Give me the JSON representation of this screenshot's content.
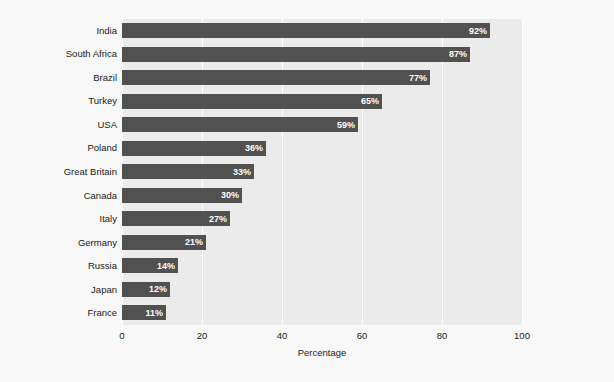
{
  "chart_data": {
    "type": "bar",
    "orientation": "horizontal",
    "title": "",
    "subtitle": "",
    "xlabel": "Percentage",
    "ylabel": "",
    "xlim": [
      0,
      100
    ],
    "xticks": [
      0,
      20,
      40,
      60,
      80,
      100
    ],
    "xtick_labels": [
      "0",
      "20",
      "40",
      "60",
      "80",
      "100"
    ],
    "grid": true,
    "grid_axis": "x",
    "legend": false,
    "legend_position": "none",
    "categories": [
      "India",
      "South Africa",
      "Brazil",
      "Turkey",
      "USA",
      "Poland",
      "Great Britain",
      "Canada",
      "Italy",
      "Germany",
      "Russia",
      "Japan",
      "France"
    ],
    "values": [
      92,
      87,
      77,
      65,
      59,
      36,
      33,
      30,
      27,
      21,
      14,
      12,
      11
    ],
    "value_labels": [
      "92%",
      "87%",
      "77%",
      "65%",
      "59%",
      "36%",
      "33%",
      "30%",
      "27%",
      "21%",
      "14%",
      "12%",
      "11%"
    ],
    "colors": {
      "bar": "#515151",
      "value_label": "#ffffff",
      "plot_background": "#ebebeb",
      "figure_background": "#f8f8f8",
      "gridline": "#ffffff",
      "text": "#1a1a1a"
    }
  }
}
